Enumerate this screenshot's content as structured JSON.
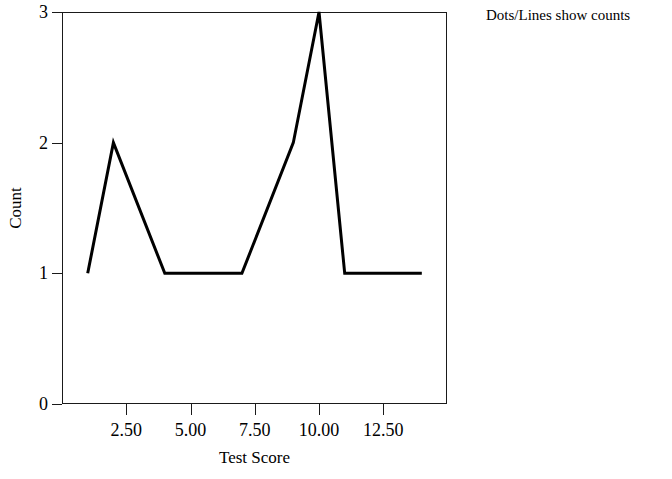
{
  "chart_data": {
    "type": "line",
    "title": "",
    "subtitle": "",
    "xlabel": "Test Score",
    "ylabel": "Count",
    "xlim": [
      0,
      14.98
    ],
    "ylim": [
      0,
      3
    ],
    "grid": false,
    "legend_position": "top-right",
    "annotation": "Dots/Lines show counts",
    "x_ticks": [
      "2.50",
      "5.00",
      "7.50",
      "10.00",
      "12.50"
    ],
    "x_tick_values": [
      2.5,
      5.0,
      7.5,
      10.0,
      12.5
    ],
    "y_ticks": [
      "0",
      "1",
      "2",
      "3"
    ],
    "y_tick_values": [
      0,
      1,
      2,
      3
    ],
    "series": [
      {
        "name": "counts",
        "color": "#000000",
        "points": [
          {
            "x": 1,
            "y": 1
          },
          {
            "x": 2,
            "y": 2
          },
          {
            "x": 4,
            "y": 1
          },
          {
            "x": 7,
            "y": 1
          },
          {
            "x": 9,
            "y": 2
          },
          {
            "x": 10,
            "y": 3
          },
          {
            "x": 11,
            "y": 1
          },
          {
            "x": 14,
            "y": 1
          }
        ]
      }
    ]
  },
  "note": {
    "text": "Dots/Lines show counts"
  },
  "axes": {
    "x_title": "Test Score",
    "y_title": "Count"
  }
}
